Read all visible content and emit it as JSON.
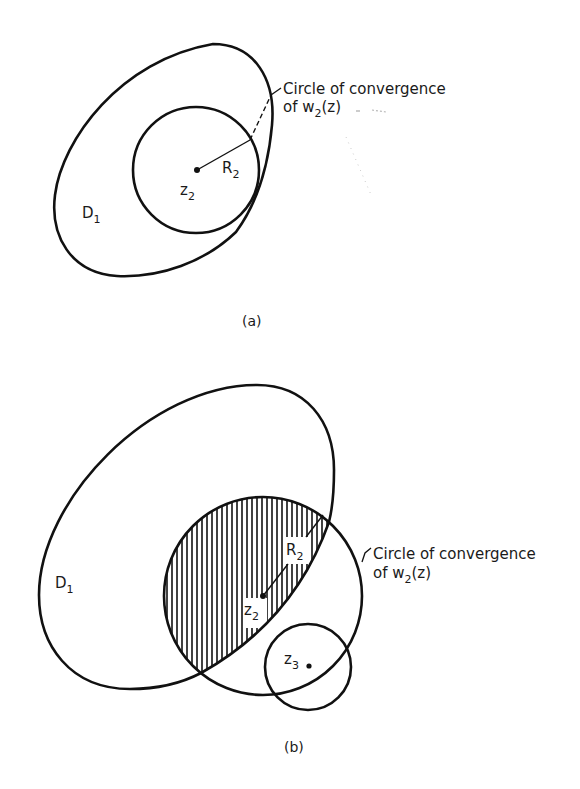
{
  "figure": {
    "panel_a": {
      "caption": "(a)",
      "region_label": {
        "main": "D",
        "sub": "1"
      },
      "center_label": {
        "main": "z",
        "sub": "2"
      },
      "radius_label": {
        "main": "R",
        "sub": "2"
      },
      "annotation": {
        "line1": "Circle of convergence",
        "line2_prefix": "of  w",
        "line2_sub": "2",
        "line2_suffix": "(z)"
      }
    },
    "panel_b": {
      "caption": "(b)",
      "region_label": {
        "main": "D",
        "sub": "1"
      },
      "center_label": {
        "main": "z",
        "sub": "2"
      },
      "radius_label": {
        "main": "R",
        "sub": "2"
      },
      "second_center_label": {
        "main": "z",
        "sub": "3"
      },
      "annotation": {
        "line1": "Circle of convergence",
        "line2_prefix": "of  w",
        "line2_sub": "2",
        "line2_suffix": "(z)"
      }
    },
    "colors": {
      "stroke": "#111111",
      "background": "#ffffff",
      "text": "#1a1a1a"
    }
  }
}
